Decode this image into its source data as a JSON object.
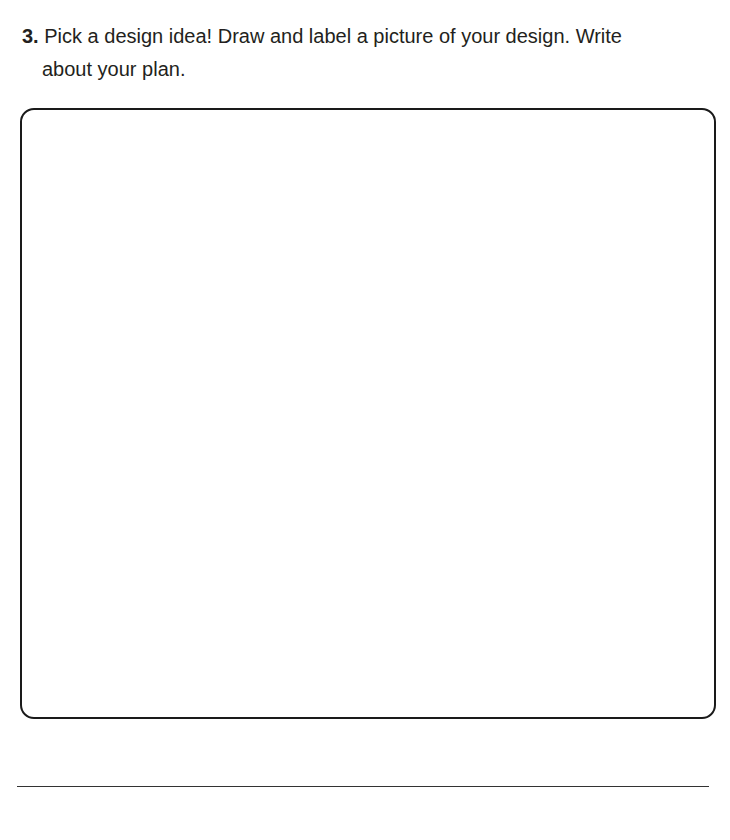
{
  "question": {
    "number": "3.",
    "line1": "Pick a design idea! Draw and label a picture of your design. Write",
    "line2": "about your plan."
  },
  "drawing_box": {
    "content": ""
  },
  "writing_lines": [
    {
      "value": ""
    }
  ]
}
